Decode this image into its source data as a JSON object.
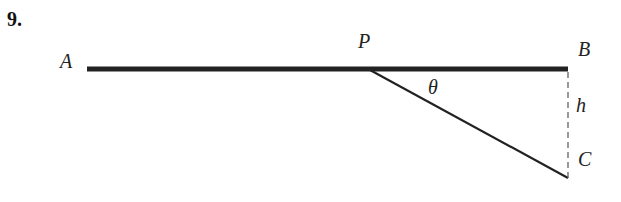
{
  "problem_number": "9.",
  "labels": {
    "A": "A",
    "P": "P",
    "B": "B",
    "C": "C",
    "theta": "θ",
    "h": "h"
  },
  "diagram": {
    "segments": [
      {
        "name": "AB",
        "from": [
          87,
          69
        ],
        "to": [
          568,
          69
        ],
        "style": "thick"
      },
      {
        "name": "PC",
        "from": [
          370,
          70
        ],
        "to": [
          568,
          178
        ],
        "style": "solid"
      },
      {
        "name": "BC",
        "from": [
          568,
          72
        ],
        "to": [
          568,
          178
        ],
        "style": "dashed"
      }
    ],
    "colors": {
      "line": "#222222",
      "text": "#222222"
    }
  }
}
